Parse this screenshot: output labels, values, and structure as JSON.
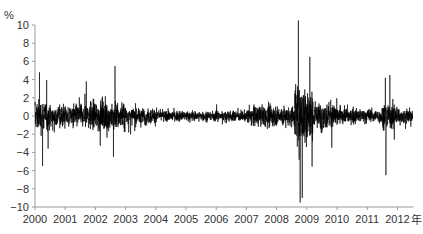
{
  "chart_data": {
    "type": "line",
    "title": "",
    "ylabel": "%",
    "xlabel": "",
    "x_unit_label": "年",
    "ylim": [
      -10,
      10
    ],
    "yticks": [
      10,
      8,
      6,
      4,
      2,
      0,
      -2,
      -4,
      -6,
      -8,
      -10
    ],
    "xticks": [
      "2000",
      "2001",
      "2002",
      "2003",
      "2004",
      "2005",
      "2006",
      "2007",
      "2008",
      "2009",
      "2010",
      "2011",
      "2012"
    ],
    "xrange": [
      2000.0,
      2012.5
    ],
    "grid": false,
    "legend": null,
    "series": [
      {
        "name": "daily return",
        "color": "#000000",
        "description": "Daily percentage changes; dense high-frequency series",
        "volatility_regimes": [
          {
            "from": 2000.0,
            "to": 2000.5,
            "amplitude": 2.2
          },
          {
            "from": 2000.5,
            "to": 2001.8,
            "amplitude": 1.6
          },
          {
            "from": 2001.8,
            "to": 2003.0,
            "amplitude": 2.0
          },
          {
            "from": 2003.0,
            "to": 2004.0,
            "amplitude": 1.1
          },
          {
            "from": 2004.0,
            "to": 2007.0,
            "amplitude": 0.7
          },
          {
            "from": 2007.0,
            "to": 2008.6,
            "amplitude": 1.4
          },
          {
            "from": 2008.6,
            "to": 2009.2,
            "amplitude": 4.5
          },
          {
            "from": 2009.2,
            "to": 2010.0,
            "amplitude": 1.8
          },
          {
            "from": 2010.0,
            "to": 2011.5,
            "amplitude": 1.0
          },
          {
            "from": 2011.5,
            "to": 2012.0,
            "amplitude": 1.8
          },
          {
            "from": 2012.0,
            "to": 2012.5,
            "amplitude": 1.0
          }
        ],
        "notable_points": [
          {
            "x": 2000.15,
            "y": 4.8
          },
          {
            "x": 2000.25,
            "y": -5.5
          },
          {
            "x": 2001.7,
            "y": 3.8
          },
          {
            "x": 2002.65,
            "y": 5.5
          },
          {
            "x": 2002.6,
            "y": -4.5
          },
          {
            "x": 2008.72,
            "y": 10.5
          },
          {
            "x": 2008.78,
            "y": -9.5
          },
          {
            "x": 2008.85,
            "y": -9.0
          },
          {
            "x": 2009.1,
            "y": 6.5
          },
          {
            "x": 2011.6,
            "y": 4.2
          },
          {
            "x": 2011.62,
            "y": -6.5
          },
          {
            "x": 2011.75,
            "y": 4.5
          }
        ]
      }
    ]
  }
}
